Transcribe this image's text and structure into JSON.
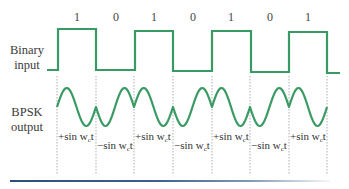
{
  "labels": {
    "binary_input_line1": "Binary",
    "binary_input_line2": "input",
    "bpsk_output_line1": "BPSK",
    "bpsk_output_line2": "output"
  },
  "bits": [
    "1",
    "0",
    "1",
    "0",
    "1",
    "0",
    "1"
  ],
  "segments": [
    {
      "sign": "+",
      "text": "+sin w",
      "sub": "c",
      "tail": "t"
    },
    {
      "sign": "-",
      "text": "−sin w",
      "sub": "c",
      "tail": "t"
    },
    {
      "sign": "+",
      "text": "+sin w",
      "sub": "c",
      "tail": "t"
    },
    {
      "sign": "-",
      "text": "−sin w",
      "sub": "c",
      "tail": "t"
    },
    {
      "sign": "+",
      "text": "+sin w",
      "sub": "c",
      "tail": "t"
    },
    {
      "sign": "-",
      "text": "−sin w",
      "sub": "c",
      "tail": "t"
    },
    {
      "sign": "+",
      "text": "+sin w",
      "sub": "c",
      "tail": "t"
    }
  ],
  "colors": {
    "waveform": "#3a9a64",
    "divider": "#9a9a9a",
    "rule": "#2f4f7a"
  }
}
